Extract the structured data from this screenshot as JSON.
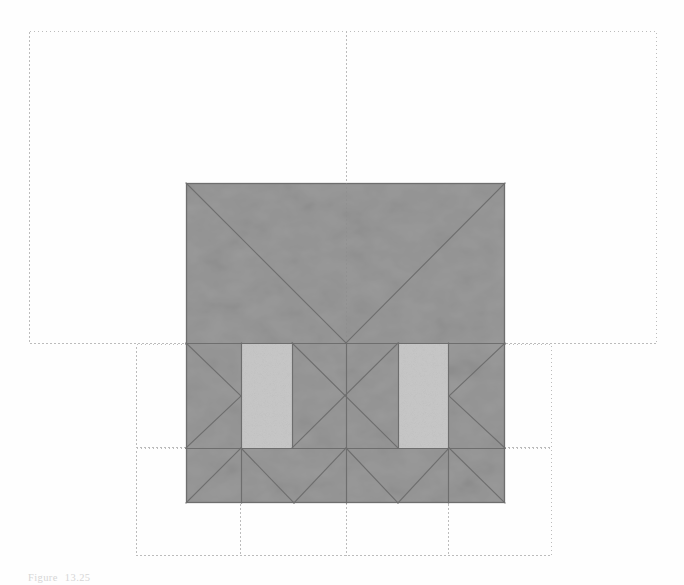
{
  "figure": {
    "caption_label": "Figure",
    "caption_number": "13.25",
    "caption_text": ""
  },
  "colors": {
    "background": "#fefefe",
    "roof_fill": "#9a9a9a",
    "dormer_fill": "#c6c6c6",
    "roof_line": "#6f6f6f",
    "roof_edge": "#707070",
    "grid_dotted": "#b9b9b9",
    "caption_text": "#d6d6d6"
  },
  "drawing": {
    "type": "roof-plan",
    "canvas": {
      "width": 684,
      "height": 585
    },
    "grid": {
      "style": "dotted",
      "rectangles": [
        {
          "name": "upper-grid-rect",
          "x": 29,
          "y": 31,
          "width": 628,
          "height": 313
        },
        {
          "name": "middle-grid-rect",
          "x": 136,
          "y": 344,
          "width": 416,
          "height": 104
        },
        {
          "name": "lower-grid-rect",
          "x": 136,
          "y": 448,
          "width": 416,
          "height": 108
        }
      ],
      "vertical_lines": [
        {
          "name": "center-axis",
          "x": 346,
          "y1": 31,
          "y2": 556
        },
        {
          "name": "left-bay-axis",
          "x": 240,
          "y1": 448,
          "y2": 556
        },
        {
          "name": "right-bay-axis",
          "x": 448,
          "y1": 448,
          "y2": 556
        }
      ]
    },
    "roof": {
      "name": "roof-mass",
      "x": 186,
      "y": 183,
      "width": 319,
      "height": 320,
      "bands": [
        {
          "name": "upper-roof-band",
          "y_top": 183,
          "y_bottom": 343,
          "kind": "hip-valley"
        },
        {
          "name": "middle-roof-band",
          "y_top": 343,
          "y_bottom": 448,
          "kind": "dormer-band"
        },
        {
          "name": "lower-roof-band",
          "y_top": 448,
          "y_bottom": 503,
          "kind": "hip-band"
        }
      ],
      "dormers": [
        {
          "name": "left-dormer",
          "x": 241,
          "y": 343,
          "width": 51,
          "height": 105
        },
        {
          "name": "right-dormer",
          "x": 398,
          "y": 343,
          "width": 51,
          "height": 105
        }
      ],
      "ridge_point": {
        "x": 346,
        "y": 343
      }
    }
  }
}
